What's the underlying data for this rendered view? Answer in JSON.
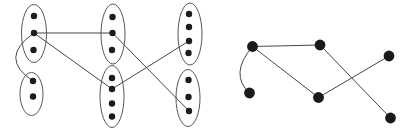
{
  "canvas": {
    "width": 413,
    "height": 133,
    "background": "#ffffff"
  },
  "colors": {
    "edge": "#474747",
    "oval_outline": "#565656",
    "dot": "#1c1c1c",
    "node": "#1a1a1a"
  },
  "chart_data": {
    "type": "diagram",
    "title": "",
    "description_visible_text": "",
    "left_graph": {
      "kind": "partitioned-graph",
      "oval_stroke_width": 1,
      "dot_radius": 3.2,
      "ovals": [
        {
          "id": "top-left",
          "cx": 34,
          "cy": 33.5,
          "rx": 12.5,
          "ry": 29
        },
        {
          "id": "bottom-left",
          "cx": 31.5,
          "cy": 94,
          "rx": 11.5,
          "ry": 21.5
        },
        {
          "id": "top-mid",
          "cx": 113,
          "cy": 34,
          "rx": 12,
          "ry": 30
        },
        {
          "id": "bottom-mid",
          "cx": 112,
          "cy": 96.5,
          "rx": 12,
          "ry": 31
        },
        {
          "id": "top-right",
          "cx": 190,
          "cy": 34,
          "rx": 12,
          "ry": 31
        },
        {
          "id": "bottom-right",
          "cx": 188,
          "cy": 98,
          "rx": 12,
          "ry": 28.5
        }
      ],
      "dots": [
        {
          "id": "a1",
          "oval": "top-left",
          "x": 34,
          "y": 16
        },
        {
          "id": "a2",
          "oval": "top-left",
          "x": 34,
          "y": 33
        },
        {
          "id": "a3",
          "oval": "top-left",
          "x": 33.5,
          "y": 50
        },
        {
          "id": "b1",
          "oval": "bottom-left",
          "x": 33,
          "y": 81
        },
        {
          "id": "b2",
          "oval": "bottom-left",
          "x": 33,
          "y": 96.5
        },
        {
          "id": "c1",
          "oval": "top-mid",
          "x": 112.5,
          "y": 17
        },
        {
          "id": "c2",
          "oval": "top-mid",
          "x": 112.5,
          "y": 33
        },
        {
          "id": "c3",
          "oval": "top-mid",
          "x": 112,
          "y": 50
        },
        {
          "id": "d1",
          "oval": "bottom-mid",
          "x": 112,
          "y": 78
        },
        {
          "id": "d2",
          "oval": "bottom-mid",
          "x": 112,
          "y": 89
        },
        {
          "id": "d3",
          "oval": "bottom-mid",
          "x": 112,
          "y": 103.5
        },
        {
          "id": "d4",
          "oval": "bottom-mid",
          "x": 112,
          "y": 116.5
        },
        {
          "id": "e1",
          "oval": "top-right",
          "x": 189,
          "y": 14
        },
        {
          "id": "e2",
          "oval": "top-right",
          "x": 189,
          "y": 27
        },
        {
          "id": "e3",
          "oval": "top-right",
          "x": 189,
          "y": 41
        },
        {
          "id": "e4",
          "oval": "top-right",
          "x": 188.5,
          "y": 53
        },
        {
          "id": "f1",
          "oval": "bottom-right",
          "x": 188.5,
          "y": 80
        },
        {
          "id": "f2",
          "oval": "bottom-right",
          "x": 188.5,
          "y": 97
        },
        {
          "id": "f3",
          "oval": "bottom-right",
          "x": 189,
          "y": 111
        }
      ],
      "edges": [
        {
          "from": "a2",
          "to": "c2",
          "type": "line"
        },
        {
          "from": "a2",
          "to": "d2",
          "type": "line"
        },
        {
          "from": "a2",
          "to": "b1",
          "type": "curve",
          "control": [
            -2,
            58
          ]
        },
        {
          "from": "c2",
          "to": "f3",
          "type": "line"
        },
        {
          "from": "d2",
          "to": "e3",
          "type": "line"
        }
      ]
    },
    "right_graph": {
      "kind": "quotient-graph",
      "node_radius": 5.4,
      "nodes": [
        {
          "id": "A",
          "x": 252.5,
          "y": 46.5
        },
        {
          "id": "B",
          "x": 320,
          "y": 45
        },
        {
          "id": "C",
          "x": 389,
          "y": 56
        },
        {
          "id": "D",
          "x": 249.5,
          "y": 93
        },
        {
          "id": "E",
          "x": 318.5,
          "y": 97.5
        },
        {
          "id": "F",
          "x": 390.5,
          "y": 118
        }
      ],
      "edges": [
        {
          "from": "A",
          "to": "B",
          "type": "line"
        },
        {
          "from": "A",
          "to": "E",
          "type": "line"
        },
        {
          "from": "A",
          "to": "D",
          "type": "curve",
          "control": [
            229,
            74
          ]
        },
        {
          "from": "B",
          "to": "F",
          "type": "line"
        },
        {
          "from": "C",
          "to": "E",
          "type": "line"
        }
      ]
    }
  }
}
